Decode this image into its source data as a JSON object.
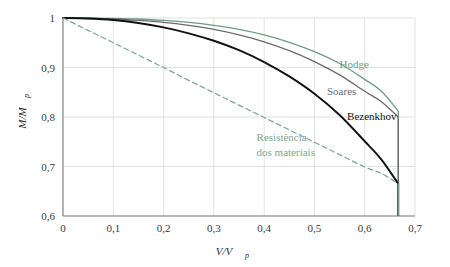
{
  "figure": {
    "title": "",
    "background_color": "#ffffff"
  },
  "axes": {
    "x": {
      "title_main": "V/V",
      "title_sub": "p",
      "ticks": [
        "0",
        "0,1",
        "0,2",
        "0,3",
        "0,4",
        "0,5",
        "0,6",
        "0,7"
      ],
      "tick_values": [
        0,
        0.1,
        0.2,
        0.3,
        0.4,
        0.5,
        0.6,
        0.7
      ],
      "min": 0,
      "max": 0.7
    },
    "y": {
      "title_main": "M/M",
      "title_sub": "p",
      "ticks": [
        "0,6",
        "0,7",
        "0,8",
        "0,9",
        "1"
      ],
      "tick_values": [
        0.6,
        0.7,
        0.8,
        0.9,
        1.0
      ],
      "min": 0.6,
      "max": 1.0
    },
    "grid": true,
    "grid_color": "#d7dcd9",
    "frame_color": "#7d8480"
  },
  "labels": {
    "hodge": "Hodge",
    "soares": "Soares",
    "bezenkhov": "Bezenkhov",
    "resistencia_line1": "Resistência",
    "resistencia_line2": "dos materiais"
  },
  "colors": {
    "hodge": "#6f9b86",
    "soares": "#6b6b6b",
    "bezenkhov": "#111111",
    "resistencia": "#7aa893",
    "grid": "#d7dcd9",
    "frame": "#7d8480",
    "text": "#3a3a3a"
  },
  "chart_data": {
    "type": "line",
    "title": "",
    "xlabel": "V/Vp",
    "ylabel": "M/Mp",
    "xlim": [
      0,
      0.7
    ],
    "ylim": [
      0.6,
      1.0
    ],
    "grid": true,
    "legend": "inline-annotations",
    "x": [
      0,
      0.05,
      0.1,
      0.15,
      0.2,
      0.25,
      0.3,
      0.35,
      0.4,
      0.45,
      0.5,
      0.55,
      0.6,
      0.6333,
      0.6667
    ],
    "series": [
      {
        "name": "Hodge",
        "color": "#6f9b86",
        "style": "solid",
        "values": [
          1.0,
          1.0,
          0.999,
          0.998,
          0.995,
          0.991,
          0.985,
          0.977,
          0.966,
          0.951,
          0.932,
          0.908,
          0.876,
          0.852,
          0.812
        ],
        "terminal_drop_to": 0.6
      },
      {
        "name": "Soares",
        "color": "#6b6b6b",
        "style": "solid",
        "values": [
          1.0,
          0.999,
          0.998,
          0.995,
          0.991,
          0.985,
          0.977,
          0.966,
          0.952,
          0.934,
          0.912,
          0.885,
          0.852,
          0.831,
          0.8
        ],
        "terminal_drop_to": 0.6
      },
      {
        "name": "Bezenkhov",
        "color": "#111111",
        "style": "solid",
        "values": [
          1.0,
          0.999,
          0.996,
          0.99,
          0.981,
          0.969,
          0.954,
          0.935,
          0.911,
          0.882,
          0.847,
          0.804,
          0.751,
          0.714,
          0.665
        ],
        "terminal_drop_to": 0.6
      },
      {
        "name": "Resistência dos materiais",
        "color": "#7aa893",
        "style": "dashed",
        "values": [
          1.0,
          0.975,
          0.95,
          0.925,
          0.9,
          0.874,
          0.849,
          0.824,
          0.799,
          0.774,
          0.749,
          0.724,
          0.699,
          0.686,
          0.665
        ],
        "terminal_drop_to": 0.6
      }
    ],
    "annotations": [
      {
        "text": "Hodge",
        "x": 0.55,
        "y": 0.898,
        "color": "#6f9b86"
      },
      {
        "text": "Soares",
        "x": 0.525,
        "y": 0.845,
        "color": "#6b6b6b"
      },
      {
        "text": "Bezenkhov",
        "x": 0.565,
        "y": 0.793,
        "color": "#111111"
      },
      {
        "text": "Resistência",
        "x": 0.385,
        "y": 0.752,
        "color": "#7aa893"
      },
      {
        "text": "dos materiais",
        "x": 0.385,
        "y": 0.722,
        "color": "#7aa893"
      }
    ]
  }
}
